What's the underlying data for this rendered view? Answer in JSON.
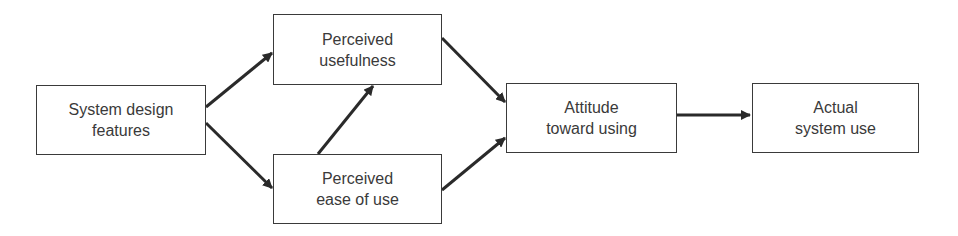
{
  "diagram": {
    "type": "flowchart",
    "nodes": [
      {
        "id": "sdf",
        "lines": [
          "System design",
          "features"
        ]
      },
      {
        "id": "pu",
        "lines": [
          "Perceived",
          "usefulness"
        ]
      },
      {
        "id": "peou",
        "lines": [
          "Perceived",
          "ease of use"
        ]
      },
      {
        "id": "att",
        "lines": [
          "Attitude",
          "toward using"
        ]
      },
      {
        "id": "use",
        "lines": [
          "Actual",
          "system use"
        ]
      }
    ],
    "edges": [
      {
        "from": "sdf",
        "to": "pu"
      },
      {
        "from": "sdf",
        "to": "peou"
      },
      {
        "from": "peou",
        "to": "pu"
      },
      {
        "from": "pu",
        "to": "att"
      },
      {
        "from": "peou",
        "to": "att"
      },
      {
        "from": "att",
        "to": "use"
      }
    ],
    "colors": {
      "stroke": "#3a3a3a",
      "background": "#ffffff"
    }
  }
}
